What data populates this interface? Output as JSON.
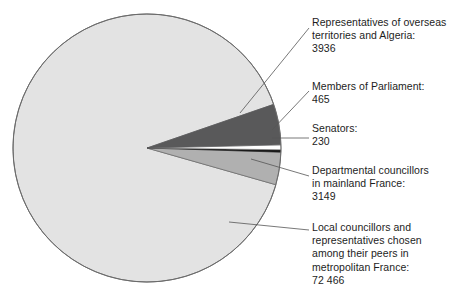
{
  "chart_data": {
    "type": "pie",
    "title": "",
    "subtitle": "",
    "xlabel": "",
    "ylabel": "",
    "legend_position": "callout-labels-right",
    "grid": false,
    "total": 80246,
    "categories": [
      "Representatives of overseas territories and Algeria",
      "Members of Parliament",
      "Senators",
      "Departmental councillors in mainland France",
      "Local councillors and representatives chosen among their peers in metropolitan France"
    ],
    "values": [
      3936,
      465,
      230,
      3149,
      72466
    ],
    "value_labels": [
      "3936",
      "465",
      "230",
      "3149",
      "72 466"
    ],
    "colors": [
      "#59595a",
      "#ffffff",
      "#1a1a1a",
      "#b0b0b0",
      "#e3e3e3"
    ],
    "slices": [
      {
        "name": "overseas-territories",
        "label_lines": [
          "Representatives of overseas",
          "territories and Algeria:",
          "3936"
        ],
        "value": 3936,
        "value_label": "3936",
        "color": "#59595a",
        "percent": "4.9"
      },
      {
        "name": "members-of-parliament",
        "label_lines": [
          "Members of Parliament:",
          "465"
        ],
        "value": 465,
        "value_label": "465",
        "color": "#ffffff",
        "percent": "0.6"
      },
      {
        "name": "senators",
        "label_lines": [
          "Senators:",
          "230"
        ],
        "value": 230,
        "value_label": "230",
        "color": "#1a1a1a",
        "percent": "0.3"
      },
      {
        "name": "departmental-councillors",
        "label_lines": [
          "Departmental councillors",
          "in mainland France:",
          "3149"
        ],
        "value": 3149,
        "value_label": "3149",
        "color": "#b0b0b0",
        "percent": "3.9"
      },
      {
        "name": "local-councillors",
        "label_lines": [
          "Local councillors and",
          "representatives chosen",
          "among their peers in",
          "metropolitan France:",
          "72 466"
        ],
        "value": 72466,
        "value_label": "72 466",
        "color": "#e3e3e3",
        "percent": "90.3"
      }
    ]
  },
  "labels": {
    "overseas": "Representatives of overseas\nterritories and Algeria:\n3936",
    "parliament": "Members of Parliament:\n465",
    "senators": "Senators:\n230",
    "departmental": "Departmental councillors\nin mainland France:\n3149",
    "local": "Local councillors and\nrepresentatives chosen\namong their peers in\nmetropolitan France:\n72 466"
  },
  "style": {
    "outline_color": "#6b6b6b",
    "leader_color": "#555555",
    "text_color": "#1d1d1d",
    "background": "#ffffff"
  }
}
